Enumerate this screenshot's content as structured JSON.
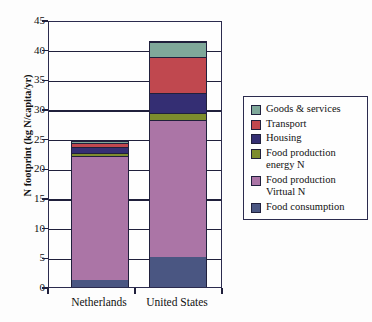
{
  "chart_data": {
    "type": "bar",
    "subtype": "stacked",
    "title": "",
    "xlabel": "",
    "ylabel": "N footprint (kg N/capita/yr)",
    "categories": [
      "Netherlands",
      "United States"
    ],
    "ylim": [
      0,
      45
    ],
    "yticks": [
      0,
      5,
      10,
      15,
      20,
      25,
      30,
      35,
      40,
      45
    ],
    "grid": true,
    "legend_position": "right",
    "series": [
      {
        "name": "Food consumption",
        "color": "#4a5682",
        "values": [
          1.2,
          5.0
        ]
      },
      {
        "name": "Food production Virtual N",
        "color": "#ab75a6",
        "values": [
          21.0,
          23.3
        ]
      },
      {
        "name": "Food production energy N",
        "color": "#7d8c2e",
        "values": [
          0.6,
          1.2
        ]
      },
      {
        "name": "Housing",
        "color": "#342e73",
        "values": [
          1.0,
          3.3
        ]
      },
      {
        "name": "Transport",
        "color": "#c0484f",
        "values": [
          0.7,
          6.1
        ]
      },
      {
        "name": "Goods & services",
        "color": "#7fa89a",
        "values": [
          0.3,
          2.5
        ]
      }
    ],
    "totals": [
      24.8,
      41.4
    ],
    "legend_order": [
      "Goods & services",
      "Transport",
      "Housing",
      "Food production energy N",
      "Food production Virtual N",
      "Food consumption"
    ],
    "legend_entries": [
      {
        "label_line1": "Goods & services",
        "label_line2": "",
        "color": "#7fa89a"
      },
      {
        "label_line1": "Transport",
        "label_line2": "",
        "color": "#c0484f"
      },
      {
        "label_line1": "Housing",
        "label_line2": "",
        "color": "#342e73"
      },
      {
        "label_line1": "Food production",
        "label_line2": "energy N",
        "color": "#7d8c2e"
      },
      {
        "label_line1": "Food production",
        "label_line2": "Virtual N",
        "color": "#ab75a6"
      },
      {
        "label_line1": "Food consumption",
        "label_line2": "",
        "color": "#4a5682"
      }
    ]
  }
}
